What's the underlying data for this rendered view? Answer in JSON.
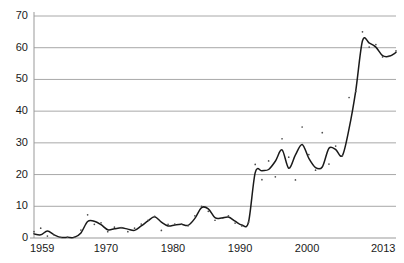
{
  "chart_data": {
    "type": "line",
    "title": "",
    "subtitle": "",
    "xlabel": "",
    "ylabel": "",
    "xlim": [
      1959,
      2013
    ],
    "ylim": [
      0,
      70
    ],
    "grid": true,
    "legend": false,
    "legend_position": "none",
    "annotations": [],
    "y_ticks": [
      0,
      10,
      20,
      30,
      40,
      50,
      60,
      70
    ],
    "y_tick_labels": [
      "0",
      "10",
      "20",
      "30",
      "40",
      "50",
      "60",
      "70"
    ],
    "x_ticks": [
      1959,
      1970,
      1980,
      1990,
      2000,
      2013
    ],
    "x_tick_labels": [
      "1959",
      "1970",
      "1980",
      "1990",
      "2000",
      "2013"
    ],
    "x": [
      1959,
      1960,
      1961,
      1962,
      1963,
      1964,
      1965,
      1966,
      1967,
      1968,
      1969,
      1970,
      1971,
      1972,
      1973,
      1974,
      1975,
      1976,
      1977,
      1978,
      1979,
      1980,
      1981,
      1982,
      1983,
      1984,
      1985,
      1986,
      1987,
      1988,
      1989,
      1990,
      1991,
      1992,
      1993,
      1994,
      1995,
      1996,
      1997,
      1998,
      1999,
      2000,
      2001,
      2002,
      2003,
      2004,
      2005,
      2006,
      2007,
      2008,
      2009,
      2010,
      2011,
      2012,
      2013
    ],
    "series": [
      {
        "name": "smoothed-trend",
        "style": "line",
        "color": "#1a1a1a",
        "values": [
          1.3,
          1.0,
          2.2,
          1.0,
          0.2,
          0.2,
          0.2,
          1.6,
          5.2,
          5.3,
          4.2,
          2.6,
          2.9,
          3.2,
          2.8,
          2.4,
          3.8,
          5.4,
          6.7,
          5.0,
          3.8,
          4.1,
          4.3,
          4.0,
          6.2,
          9.6,
          9.2,
          6.4,
          6.3,
          6.6,
          5.3,
          4.1,
          5.0,
          20.6,
          21.2,
          21.6,
          24.2,
          27.8,
          22.0,
          26.2,
          29.5,
          25.1,
          22.2,
          22.4,
          28.3,
          27.9,
          26.0,
          34.5,
          46.5,
          62.2,
          61.5,
          60.2,
          57.5,
          57.3,
          58.5
        ]
      },
      {
        "name": "observed-points",
        "style": "scatter",
        "color": "#4d4d4d",
        "values": [
          2.0,
          3.1,
          0.6,
          1.0,
          0.2,
          0.2,
          0.3,
          2.5,
          7.3,
          4.3,
          4.8,
          2.0,
          3.4,
          3.3,
          2.0,
          3.1,
          4.4,
          5.6,
          6.8,
          2.4,
          4.3,
          4.4,
          4.4,
          3.9,
          7.0,
          10.0,
          8.4,
          5.6,
          6.3,
          7.0,
          4.7,
          3.8,
          5.0,
          23.2,
          18.4,
          24.3,
          19.3,
          31.3,
          25.5,
          18.3,
          35.0,
          26.3,
          21.4,
          33.2,
          23.3,
          29.0,
          25.9,
          44.3,
          46.2,
          65.0,
          60.2,
          61.0,
          57.1,
          57.4,
          59.0
        ]
      }
    ]
  },
  "axes": {
    "y_axis_name": "value-axis",
    "x_axis_name": "year-axis"
  },
  "colors": {
    "line": "#1a1a1a",
    "point": "#4d4d4d",
    "grid": "#a8a8a8",
    "axis": "#999999",
    "text": "#1a1a1a",
    "background": "#ffffff"
  }
}
